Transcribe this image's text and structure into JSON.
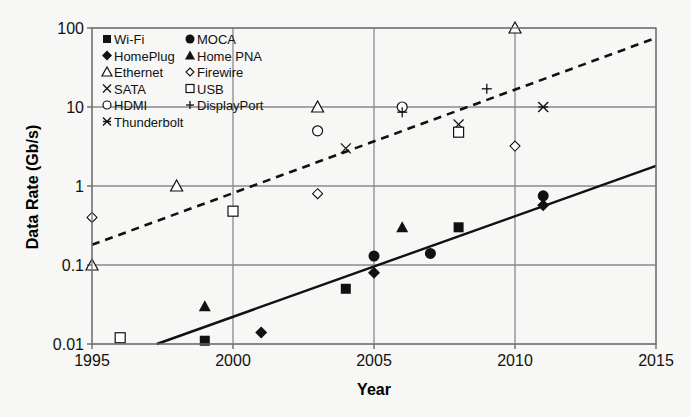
{
  "chart_data": {
    "type": "scatter",
    "title": "",
    "xlabel": "Year",
    "ylabel": "Data Rate (Gb/s)",
    "xlim": [
      1995,
      2015
    ],
    "ylim": [
      0.01,
      100
    ],
    "yscale": "log",
    "grid": true,
    "legend_position": "upper-left inside",
    "x_ticks": [
      "1995",
      "2000",
      "2005",
      "2010",
      "2015"
    ],
    "y_ticks": [
      "0.01",
      "0.1",
      "1",
      "10",
      "100"
    ],
    "series": [
      {
        "name": "Wi-Fi",
        "marker": "filled-square",
        "points": [
          [
            1999,
            0.011
          ],
          [
            2004,
            0.05
          ],
          [
            2008,
            0.3
          ]
        ]
      },
      {
        "name": "MOCA",
        "marker": "filled-circle",
        "points": [
          [
            2005,
            0.13
          ],
          [
            2007,
            0.14
          ],
          [
            2011,
            0.75
          ]
        ]
      },
      {
        "name": "HomePlug",
        "marker": "filled-diamond",
        "points": [
          [
            2001,
            0.014
          ],
          [
            2005,
            0.08
          ],
          [
            2011,
            0.57
          ]
        ]
      },
      {
        "name": "Home PNA",
        "marker": "filled-triangle",
        "points": [
          [
            1999,
            0.03
          ],
          [
            2006,
            0.3
          ]
        ]
      },
      {
        "name": "Ethernet",
        "marker": "open-triangle",
        "points": [
          [
            1995,
            0.1
          ],
          [
            1998,
            1
          ],
          [
            2003,
            10
          ],
          [
            2010,
            100
          ]
        ]
      },
      {
        "name": "Firewire",
        "marker": "open-diamond",
        "points": [
          [
            1995,
            0.4
          ],
          [
            2003,
            0.8
          ],
          [
            2010,
            3.2
          ]
        ]
      },
      {
        "name": "SATA",
        "marker": "x",
        "points": [
          [
            2004,
            3
          ],
          [
            2008,
            6
          ]
        ]
      },
      {
        "name": "USB",
        "marker": "open-square",
        "points": [
          [
            1996,
            0.012
          ],
          [
            2000,
            0.48
          ],
          [
            2008,
            4.8
          ]
        ]
      },
      {
        "name": "HDMI",
        "marker": "open-circle",
        "points": [
          [
            2003,
            5
          ],
          [
            2006,
            10
          ]
        ]
      },
      {
        "name": "DisplayPort",
        "marker": "plus",
        "points": [
          [
            2006,
            8.6
          ],
          [
            2009,
            17
          ]
        ]
      },
      {
        "name": "Thunderbolt",
        "marker": "asterisk",
        "points": [
          [
            2011,
            10
          ]
        ]
      }
    ],
    "trend_lines": [
      {
        "name": "wired trend",
        "style": "dashed",
        "points": [
          [
            1995,
            0.18
          ],
          [
            2015,
            75
          ]
        ]
      },
      {
        "name": "wireless/home trend",
        "style": "solid",
        "points": [
          [
            1997.3,
            0.01
          ],
          [
            2015,
            1.8
          ]
        ]
      }
    ]
  },
  "legend": {
    "left": [
      "Wi-Fi",
      "HomePlug",
      "Ethernet",
      "SATA",
      "HDMI",
      "Thunderbolt"
    ],
    "right": [
      "MOCA",
      "Home PNA",
      "Firewire",
      "USB",
      "DisplayPort"
    ]
  }
}
